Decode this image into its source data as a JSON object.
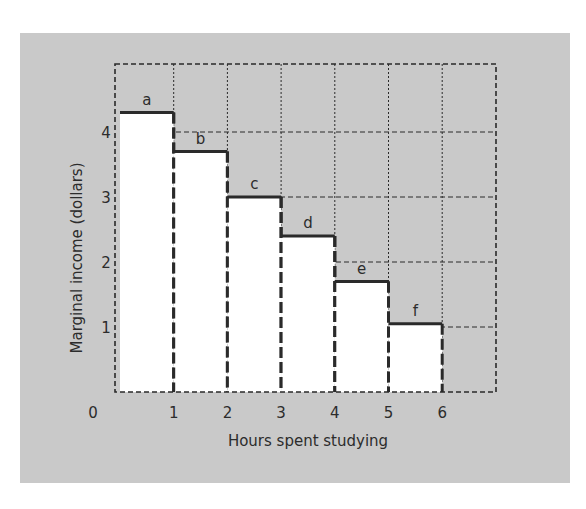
{
  "chart_data": {
    "type": "bar",
    "style": "step bars (histogram-like), each 1 hour wide, white fill, dashed vertical edges, solid top edge",
    "title": "",
    "xlabel": "Hours spent studying",
    "ylabel": "Marginal income (dollars)",
    "x_ticks": [
      "0",
      "1",
      "2",
      "3",
      "4",
      "5",
      "6"
    ],
    "y_ticks": [
      "1",
      "2",
      "3",
      "4"
    ],
    "xlim": [
      0,
      6
    ],
    "ylim": [
      0,
      5
    ],
    "grid": true,
    "categories": [
      "a",
      "b",
      "c",
      "d",
      "e",
      "f"
    ],
    "bins": [
      [
        0,
        1
      ],
      [
        1,
        2
      ],
      [
        2,
        3
      ],
      [
        3,
        4
      ],
      [
        4,
        5
      ],
      [
        5,
        6
      ]
    ],
    "values": [
      4.3,
      3.7,
      3.0,
      2.4,
      1.7,
      1.05
    ],
    "bar_labels": [
      "a",
      "b",
      "c",
      "d",
      "e",
      "f"
    ]
  },
  "colors": {
    "panel_bg": "#c9c9c9",
    "bar_fill": "#ffffff",
    "ink": "#2a2a2a"
  }
}
